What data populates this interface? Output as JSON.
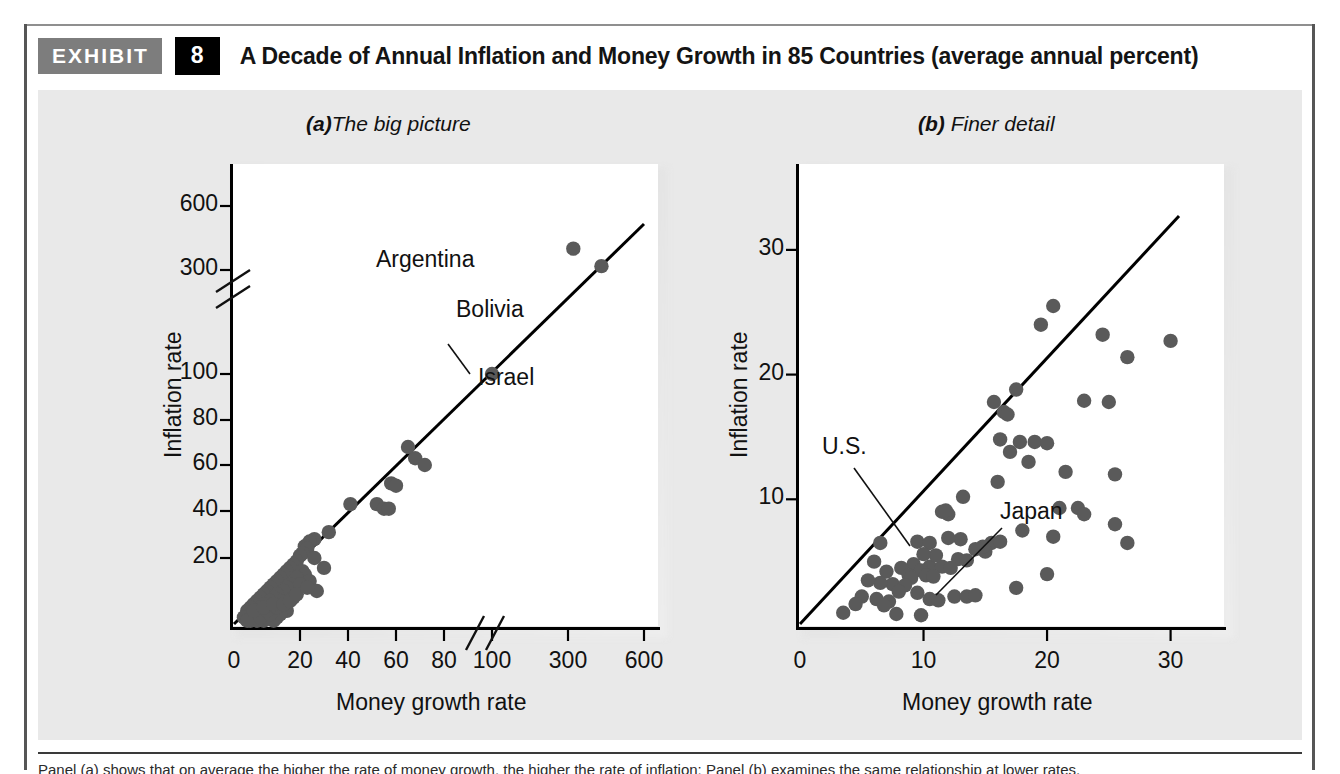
{
  "header": {
    "badge_label": "EXHIBIT",
    "number": "8",
    "title": "A Decade of Annual Inflation and Money Growth in 85 Countries (average annual percent)"
  },
  "caption": {
    "text": "Panel (a) shows that on average the higher the rate of money growth, the higher the rate of inflation; Panel (b) examines the same relationship at lower rates."
  },
  "chart_data": [
    {
      "type": "scatter",
      "panel_label": "(a)",
      "panel_title": "The big picture",
      "title": "(a) The big picture",
      "xlabel": "Money growth rate",
      "ylabel": "Inflation rate",
      "xticks": [
        "0",
        "20",
        "40",
        "60",
        "80",
        "100",
        "300",
        "600"
      ],
      "yticks": [
        "20",
        "40",
        "60",
        "80",
        "100",
        "300",
        "600"
      ],
      "axis_break_x": true,
      "axis_break_y": true,
      "grid": false,
      "legend": "none",
      "reference_line": "45-degree line (inflation = money growth)",
      "annotations": [
        {
          "label": "Argentina",
          "x": 320,
          "y": 400
        },
        {
          "label": "Bolivia",
          "x": 430,
          "y": 320
        },
        {
          "label": "Israel",
          "x": 100,
          "y": 100
        }
      ],
      "points": [
        [
          321,
          400
        ],
        [
          432,
          318
        ],
        [
          100,
          100
        ],
        [
          65,
          68
        ],
        [
          68,
          63
        ],
        [
          72,
          60
        ],
        [
          58,
          52
        ],
        [
          60,
          51
        ],
        [
          52,
          43
        ],
        [
          55,
          41
        ],
        [
          57,
          41
        ],
        [
          41,
          43
        ],
        [
          32,
          31
        ],
        [
          26,
          28
        ],
        [
          24,
          27
        ],
        [
          22,
          25
        ],
        [
          23,
          24
        ],
        [
          21,
          22
        ],
        [
          20,
          21
        ],
        [
          26,
          20
        ],
        [
          30,
          17
        ],
        [
          19,
          19
        ],
        [
          18,
          18
        ],
        [
          17,
          17
        ],
        [
          21,
          16
        ],
        [
          16,
          16
        ],
        [
          22,
          15
        ],
        [
          15,
          15
        ],
        [
          19,
          14
        ],
        [
          14,
          14
        ],
        [
          24,
          13
        ],
        [
          13,
          13
        ],
        [
          17,
          12
        ],
        [
          12,
          12
        ],
        [
          20,
          12
        ],
        [
          11,
          11
        ],
        [
          16,
          11
        ],
        [
          10,
          10
        ],
        [
          15,
          10
        ],
        [
          27,
          10
        ],
        [
          9,
          9
        ],
        [
          13,
          9
        ],
        [
          8,
          8
        ],
        [
          12,
          8
        ],
        [
          18,
          8
        ],
        [
          7,
          7
        ],
        [
          11,
          7
        ],
        [
          14,
          7
        ],
        [
          6,
          6
        ],
        [
          10,
          6
        ],
        [
          9,
          6
        ],
        [
          5,
          5
        ],
        [
          8,
          5
        ],
        [
          12,
          5
        ],
        [
          4,
          4
        ],
        [
          7,
          4
        ],
        [
          11,
          4
        ],
        [
          16,
          4
        ],
        [
          6,
          3
        ],
        [
          9,
          3
        ],
        [
          5,
          3
        ],
        [
          8,
          3
        ],
        [
          4,
          2
        ],
        [
          7,
          2
        ],
        [
          10,
          2
        ],
        [
          13,
          2
        ],
        [
          6,
          2
        ],
        [
          3,
          2
        ],
        [
          5,
          1
        ],
        [
          9,
          1
        ],
        [
          12,
          1
        ],
        [
          7,
          1
        ],
        [
          4,
          1
        ],
        [
          8,
          2
        ],
        [
          14,
          3
        ],
        [
          11,
          3
        ],
        [
          6,
          4
        ],
        [
          10,
          4
        ],
        [
          13,
          5
        ],
        [
          9,
          5
        ],
        [
          12,
          6
        ],
        [
          15,
          6
        ],
        [
          17,
          7
        ],
        [
          19,
          9
        ],
        [
          23,
          11
        ]
      ]
    },
    {
      "type": "scatter",
      "panel_label": "(b)",
      "panel_title": "Finer detail",
      "title": "(b) Finer detail",
      "xlabel": "Money growth rate",
      "ylabel": "Inflation rate",
      "xticks": [
        "0",
        "10",
        "20",
        "30"
      ],
      "yticks": [
        "10",
        "20",
        "30"
      ],
      "xlim": [
        0,
        34
      ],
      "ylim": [
        0,
        34
      ],
      "grid": false,
      "legend": "none",
      "reference_line": "45-degree line (inflation = money growth)",
      "annotations": [
        {
          "label": "U.S.",
          "x": 6.5,
          "y": 6.5
        },
        {
          "label": "Japan",
          "x": 10.5,
          "y": 2.0
        }
      ],
      "points": [
        [
          20.5,
          25.5
        ],
        [
          19.5,
          24.0
        ],
        [
          24.5,
          23.2
        ],
        [
          30.0,
          22.7
        ],
        [
          26.5,
          21.4
        ],
        [
          25.0,
          17.8
        ],
        [
          23.0,
          17.9
        ],
        [
          17.5,
          18.8
        ],
        [
          15.7,
          17.8
        ],
        [
          16.5,
          17.0
        ],
        [
          16.8,
          16.8
        ],
        [
          16.2,
          14.8
        ],
        [
          17.8,
          14.6
        ],
        [
          19.0,
          14.6
        ],
        [
          20.0,
          14.5
        ],
        [
          17.0,
          13.8
        ],
        [
          18.5,
          13.0
        ],
        [
          21.5,
          12.2
        ],
        [
          25.5,
          12.0
        ],
        [
          16.0,
          11.4
        ],
        [
          13.2,
          10.2
        ],
        [
          21.0,
          9.3
        ],
        [
          22.5,
          9.3
        ],
        [
          23.0,
          8.8
        ],
        [
          25.5,
          8.0
        ],
        [
          11.5,
          9.0
        ],
        [
          12.0,
          8.8
        ],
        [
          11.8,
          9.1
        ],
        [
          18.0,
          7.5
        ],
        [
          20.5,
          7.0
        ],
        [
          26.5,
          6.5
        ],
        [
          6.5,
          6.5
        ],
        [
          9.5,
          6.6
        ],
        [
          10.5,
          6.5
        ],
        [
          15.5,
          6.5
        ],
        [
          16.2,
          6.6
        ],
        [
          14.2,
          6.0
        ],
        [
          15.0,
          5.8
        ],
        [
          14.8,
          6.2
        ],
        [
          12.8,
          5.2
        ],
        [
          13.5,
          5.1
        ],
        [
          9.2,
          4.8
        ],
        [
          10.5,
          4.6
        ],
        [
          11.5,
          4.6
        ],
        [
          12.2,
          4.5
        ],
        [
          8.2,
          4.5
        ],
        [
          9.8,
          4.3
        ],
        [
          6.0,
          5.0
        ],
        [
          7.0,
          4.2
        ],
        [
          8.8,
          3.9
        ],
        [
          10.2,
          3.9
        ],
        [
          10.8,
          3.8
        ],
        [
          9.0,
          3.7
        ],
        [
          20.0,
          4.0
        ],
        [
          17.5,
          2.9
        ],
        [
          7.5,
          3.2
        ],
        [
          8.5,
          3.1
        ],
        [
          6.5,
          3.3
        ],
        [
          5.5,
          3.5
        ],
        [
          8.0,
          2.6
        ],
        [
          9.5,
          2.5
        ],
        [
          12.5,
          2.2
        ],
        [
          13.5,
          2.2
        ],
        [
          14.2,
          2.3
        ],
        [
          10.5,
          2.0
        ],
        [
          11.2,
          1.9
        ],
        [
          5.0,
          2.2
        ],
        [
          6.2,
          2.0
        ],
        [
          7.2,
          1.8
        ],
        [
          4.5,
          1.6
        ],
        [
          6.8,
          1.5
        ],
        [
          3.5,
          0.9
        ],
        [
          7.8,
          0.8
        ],
        [
          9.8,
          0.7
        ],
        [
          13.0,
          6.8
        ],
        [
          12.0,
          6.9
        ],
        [
          11.0,
          5.5
        ],
        [
          10.0,
          5.6
        ]
      ]
    }
  ]
}
